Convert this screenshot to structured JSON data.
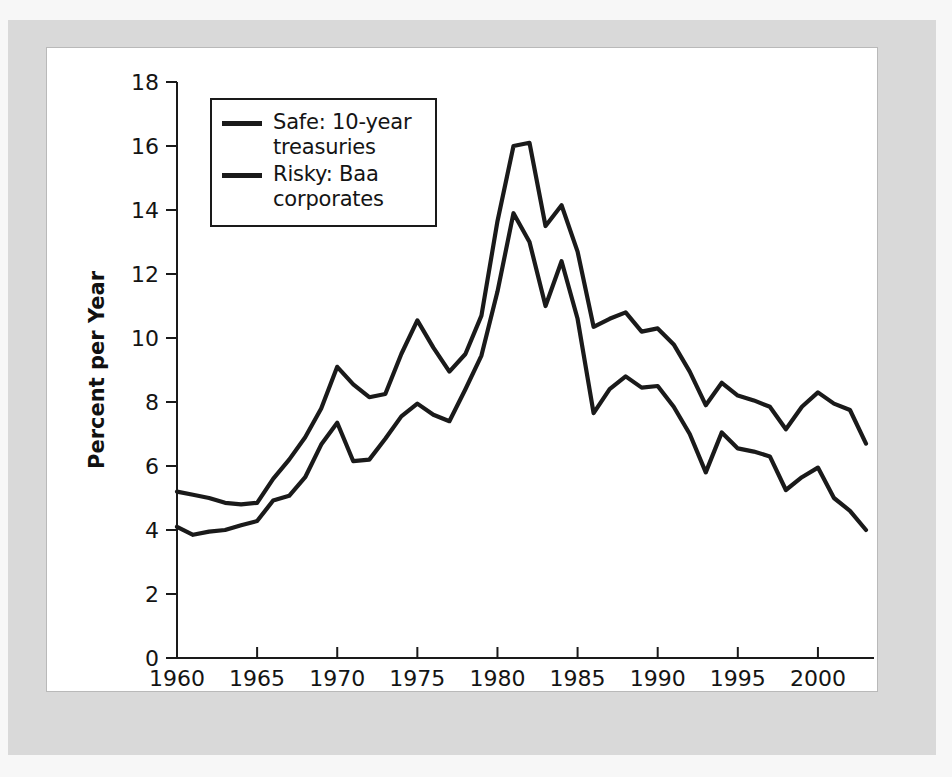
{
  "figure": {
    "background_color": "#ffffff",
    "mat_color": "#d9d9d9",
    "line_color": "#1a1a1a"
  },
  "legend": {
    "position": "top-left-inside",
    "entries": [
      {
        "label": "Safe: 10-year treasuries",
        "line1": "Safe: 10-year",
        "line2": "treasuries",
        "color": "#1a1a1a"
      },
      {
        "label": "Risky: Baa corporates",
        "line1": "Risky: Baa",
        "line2": "corporates",
        "color": "#1a1a1a"
      }
    ]
  },
  "axes": {
    "x_title": "Year",
    "y_title": "Percent per Year",
    "x_ticks": [
      "1960",
      "1965",
      "1970",
      "1975",
      "1980",
      "1985",
      "1990",
      "1995",
      "2000"
    ],
    "y_ticks": [
      "0",
      "2",
      "4",
      "6",
      "8",
      "10",
      "12",
      "14",
      "16",
      "18"
    ]
  },
  "chart_data": {
    "type": "line",
    "title": "",
    "subtitle": "",
    "xlabel": "Year",
    "ylabel": "Percent per Year",
    "xlim": [
      1960,
      2003
    ],
    "ylim": [
      0,
      18
    ],
    "xtick_values": [
      1960,
      1965,
      1970,
      1975,
      1980,
      1985,
      1990,
      1995,
      2000
    ],
    "ytick_values": [
      0,
      2,
      4,
      6,
      8,
      10,
      12,
      14,
      16,
      18
    ],
    "grid": false,
    "legend_position": "upper left",
    "x": [
      1960,
      1961,
      1962,
      1963,
      1964,
      1965,
      1966,
      1967,
      1968,
      1969,
      1970,
      1971,
      1972,
      1973,
      1974,
      1975,
      1976,
      1977,
      1978,
      1979,
      1980,
      1981,
      1982,
      1983,
      1984,
      1985,
      1986,
      1987,
      1988,
      1989,
      1990,
      1991,
      1992,
      1993,
      1994,
      1995,
      1996,
      1997,
      1998,
      1999,
      2000,
      2001,
      2002,
      2003
    ],
    "series": [
      {
        "name": "Safe: 10-year treasuries",
        "color": "#1a1a1a",
        "values": [
          4.1,
          3.85,
          3.95,
          4.0,
          4.15,
          4.28,
          4.92,
          5.07,
          5.65,
          6.67,
          7.35,
          6.15,
          6.2,
          6.85,
          7.55,
          7.95,
          7.6,
          7.4,
          8.4,
          9.45,
          11.45,
          13.9,
          13.0,
          11.0,
          12.4,
          10.6,
          7.65,
          8.4,
          8.8,
          8.45,
          8.5,
          7.85,
          7.0,
          5.8,
          7.05,
          6.55,
          6.45,
          6.3,
          5.25,
          5.65,
          5.95,
          5.0,
          4.6,
          4.0
        ]
      },
      {
        "name": "Risky: Baa corporates",
        "color": "#1a1a1a",
        "values": [
          5.2,
          5.1,
          5.0,
          4.85,
          4.8,
          4.85,
          5.6,
          6.2,
          6.9,
          7.8,
          9.1,
          8.55,
          8.15,
          8.25,
          9.5,
          10.55,
          9.7,
          8.95,
          9.5,
          10.7,
          13.65,
          16.0,
          16.1,
          13.5,
          14.15,
          12.7,
          10.35,
          10.6,
          10.8,
          10.2,
          10.3,
          9.8,
          8.95,
          7.9,
          8.6,
          8.2,
          8.05,
          7.85,
          7.15,
          7.85,
          8.3,
          7.95,
          7.75,
          6.7
        ]
      }
    ]
  }
}
